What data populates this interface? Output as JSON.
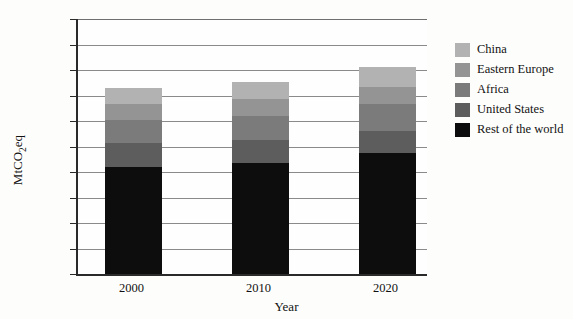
{
  "chart_data": {
    "type": "bar",
    "stacked": true,
    "title": "",
    "xlabel": "Year",
    "ylabel": "MtCO2eq",
    "ylabel_rich": "MtCO₂eq",
    "categories": [
      "2000",
      "2010",
      "2020"
    ],
    "ylim": [
      0,
      1000
    ],
    "ytick_values": [
      0,
      100,
      200,
      300,
      400,
      500,
      600,
      700,
      800,
      900,
      1000
    ],
    "ytick_labels": [
      "0",
      "100",
      "200",
      "300",
      "400",
      "500",
      "600",
      "700",
      "800",
      "900",
      "1,000"
    ],
    "grid": true,
    "legend_position": "right",
    "series": [
      {
        "name": "Rest of the world",
        "color": "#0d0d0d",
        "values": [
          420,
          435,
          475
        ]
      },
      {
        "name": "United States",
        "color": "#5d5d5d",
        "values": [
          95,
          90,
          85
        ]
      },
      {
        "name": "Africa",
        "color": "#7b7b7b",
        "values": [
          90,
          95,
          105
        ]
      },
      {
        "name": "Eastern Europe",
        "color": "#949494",
        "values": [
          60,
          65,
          70
        ]
      },
      {
        "name": "China",
        "color": "#b2b2b2",
        "values": [
          65,
          70,
          75
        ]
      }
    ],
    "totals": [
      730,
      755,
      810
    ]
  },
  "legend": {
    "items": [
      {
        "label": "China",
        "color": "#b2b2b2"
      },
      {
        "label": "Eastern Europe",
        "color": "#949494"
      },
      {
        "label": "Africa",
        "color": "#7b7b7b"
      },
      {
        "label": "United States",
        "color": "#5d5d5d"
      },
      {
        "label": "Rest of the world",
        "color": "#0d0d0d"
      }
    ]
  }
}
